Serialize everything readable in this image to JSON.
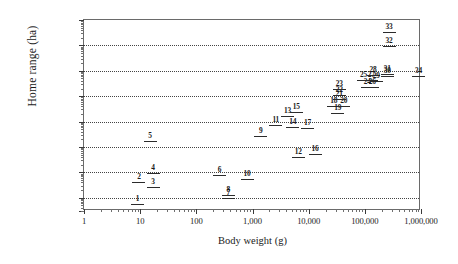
{
  "chart_data": {
    "type": "scatter",
    "title": "",
    "xlabel": "Body weight (g)",
    "ylabel": "Home range (ha)",
    "xscale": "log",
    "yscale": "log",
    "xlim": [
      1,
      1000000
    ],
    "ylim": [
      0.03,
      1000000
    ],
    "grid": true,
    "legend": "none",
    "x_tick_labels": [
      "1",
      "10",
      "100",
      "1,000",
      "10,000",
      "100,000",
      "1,000,000"
    ],
    "x_tick_values": [
      1,
      10,
      100,
      1000,
      10000,
      100000,
      1000000
    ],
    "y_tick_labels": [
      "1,000,000.0",
      "100,000.0",
      "10,000.0",
      "1,000.0",
      "100.0",
      "10.0",
      "1.0",
      "0.1",
      "0.0"
    ],
    "y_tick_values": [
      1000000,
      100000,
      10000,
      1000,
      100,
      10,
      1,
      0.1,
      0.03
    ],
    "marker_style": "horizontal-bar-with-numeric-label",
    "points": [
      {
        "id": "1",
        "x": 9,
        "y": 0.055
      },
      {
        "id": "2",
        "x": 9.5,
        "y": 0.42
      },
      {
        "id": "3",
        "x": 17,
        "y": 0.27
      },
      {
        "id": "4",
        "x": 17,
        "y": 0.95
      },
      {
        "id": "5",
        "x": 15,
        "y": 17
      },
      {
        "id": "6",
        "x": 260,
        "y": 0.8
      },
      {
        "id": "7",
        "x": 370,
        "y": 0.1
      },
      {
        "id": "8",
        "x": 370,
        "y": 0.13
      },
      {
        "id": "9",
        "x": 1400,
        "y": 27
      },
      {
        "id": "10",
        "x": 800,
        "y": 0.55
      },
      {
        "id": "11",
        "x": 2600,
        "y": 75
      },
      {
        "id": "12",
        "x": 6500,
        "y": 4.2
      },
      {
        "id": "13",
        "x": 4200,
        "y": 165
      },
      {
        "id": "14",
        "x": 5200,
        "y": 62
      },
      {
        "id": "15",
        "x": 6000,
        "y": 230
      },
      {
        "id": "16",
        "x": 13000,
        "y": 5.2
      },
      {
        "id": "17",
        "x": 9500,
        "y": 58
      },
      {
        "id": "18",
        "x": 28000,
        "y": 430
      },
      {
        "id": "19",
        "x": 33000,
        "y": 210
      },
      {
        "id": "20",
        "x": 42000,
        "y": 430
      },
      {
        "id": "21",
        "x": 35000,
        "y": 800
      },
      {
        "id": "22",
        "x": 35000,
        "y": 1150
      },
      {
        "id": "23",
        "x": 35000,
        "y": 1900
      },
      {
        "id": "24",
        "x": 110000,
        "y": 2400
      },
      {
        "id": "25",
        "x": 95000,
        "y": 4200
      },
      {
        "id": "26",
        "x": 135000,
        "y": 2400
      },
      {
        "id": "27",
        "x": 130000,
        "y": 4400
      },
      {
        "id": "28",
        "x": 140000,
        "y": 7000
      },
      {
        "id": "29",
        "x": 160000,
        "y": 4000
      },
      {
        "id": "30",
        "x": 250000,
        "y": 6500
      },
      {
        "id": "31",
        "x": 250000,
        "y": 7600
      },
      {
        "id": "32",
        "x": 270000,
        "y": 95000
      },
      {
        "id": "33",
        "x": 270000,
        "y": 330000
      },
      {
        "id": "34",
        "x": 900000,
        "y": 6200
      }
    ]
  },
  "axes": {
    "x_title": "Body weight (g)",
    "y_title": "Home range (ha)"
  }
}
